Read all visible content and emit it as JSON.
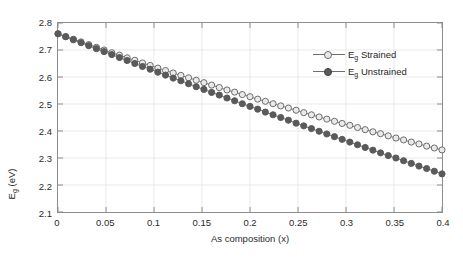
{
  "chart_data": {
    "type": "line",
    "title": "",
    "xlabel": "As composition (x)",
    "ylabel": "E_g (eV)",
    "ylabel_base": "E",
    "ylabel_sub": "g",
    "ylabel_unit": " (eV)",
    "xlim": [
      0,
      0.4
    ],
    "ylim": [
      2.1,
      2.8
    ],
    "xticks": [
      0,
      0.05,
      0.1,
      0.15,
      0.2,
      0.25,
      0.3,
      0.35,
      0.4
    ],
    "xticklabels": [
      "0",
      "0.05",
      "0.1",
      "0.15",
      "0.2",
      "0.25",
      "0.3",
      "0.35",
      "0.4"
    ],
    "yticks": [
      2.1,
      2.2,
      2.3,
      2.4,
      2.5,
      2.6,
      2.7,
      2.8
    ],
    "yticklabels": [
      "2.1",
      "2.2",
      "2.3",
      "2.4",
      "2.5",
      "2.6",
      "2.7",
      "2.8"
    ],
    "grid": true,
    "legend_position": "upper right",
    "x": [
      0,
      0.008,
      0.016,
      0.024,
      0.032,
      0.04,
      0.048,
      0.056,
      0.064,
      0.072,
      0.08,
      0.088,
      0.096,
      0.104,
      0.112,
      0.12,
      0.128,
      0.136,
      0.144,
      0.152,
      0.16,
      0.168,
      0.176,
      0.184,
      0.192,
      0.2,
      0.208,
      0.216,
      0.224,
      0.232,
      0.24,
      0.248,
      0.256,
      0.264,
      0.272,
      0.28,
      0.288,
      0.296,
      0.304,
      0.312,
      0.32,
      0.328,
      0.336,
      0.344,
      0.352,
      0.36,
      0.368,
      0.376,
      0.384,
      0.392,
      0.4
    ],
    "series": [
      {
        "name": "E_g Strained",
        "label_base": "E",
        "label_sub": "g",
        "label_rest": " Strained",
        "marker": "open-circle",
        "color": "#6b6b6b",
        "fill": "#eaeaea",
        "values": [
          2.76,
          2.75,
          2.74,
          2.73,
          2.72,
          2.71,
          2.7,
          2.69,
          2.681,
          2.671,
          2.662,
          2.652,
          2.643,
          2.633,
          2.624,
          2.615,
          2.606,
          2.597,
          2.588,
          2.579,
          2.57,
          2.561,
          2.552,
          2.544,
          2.535,
          2.527,
          2.518,
          2.51,
          2.501,
          2.493,
          2.485,
          2.477,
          2.468,
          2.46,
          2.452,
          2.444,
          2.436,
          2.428,
          2.421,
          2.413,
          2.405,
          2.397,
          2.39,
          2.382,
          2.374,
          2.367,
          2.359,
          2.352,
          2.344,
          2.337,
          2.33
        ]
      },
      {
        "name": "E_g Unstrained",
        "label_base": "E",
        "label_sub": "g",
        "label_rest": " Unstrained",
        "marker": "filled-circle",
        "color": "#5a5a5a",
        "fill": "#5a5a5a",
        "values": [
          2.76,
          2.749,
          2.738,
          2.727,
          2.716,
          2.705,
          2.694,
          2.683,
          2.672,
          2.661,
          2.65,
          2.639,
          2.629,
          2.618,
          2.607,
          2.596,
          2.586,
          2.575,
          2.564,
          2.554,
          2.543,
          2.533,
          2.522,
          2.512,
          2.501,
          2.491,
          2.481,
          2.47,
          2.46,
          2.45,
          2.44,
          2.429,
          2.419,
          2.409,
          2.399,
          2.389,
          2.379,
          2.369,
          2.359,
          2.349,
          2.339,
          2.329,
          2.319,
          2.309,
          2.3,
          2.29,
          2.28,
          2.27,
          2.261,
          2.251,
          2.241
        ]
      }
    ]
  },
  "legend": {
    "items": [
      {
        "base": "E",
        "sub": "g",
        "rest": " Strained"
      },
      {
        "base": "E",
        "sub": "g",
        "rest": " Unstrained"
      }
    ]
  },
  "axes": {
    "x_title": "As composition (x)",
    "y_title_base": "E",
    "y_title_sub": "g",
    "y_title_rest": " (eV)"
  },
  "colors": {
    "axis": "#8d8d8d",
    "grid": "#e9e9e9",
    "strained_edge": "#6b6b6b",
    "strained_fill": "#eaeaea",
    "unstrained": "#5a5a5a",
    "text": "#2b2b2b",
    "background": "#ffffff"
  }
}
